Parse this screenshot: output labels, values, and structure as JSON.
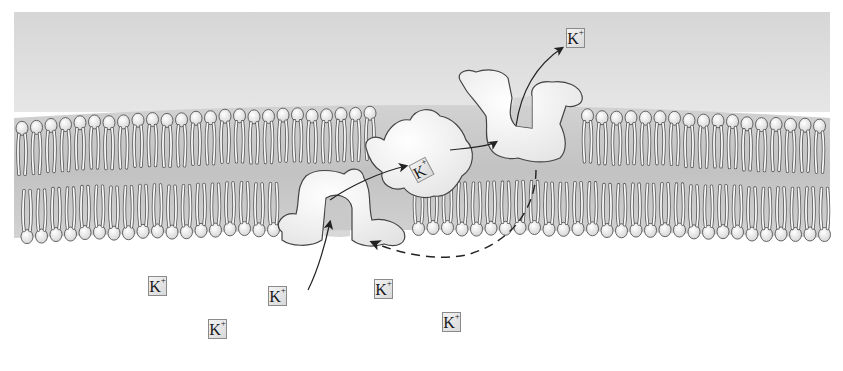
{
  "diagram": {
    "regions": {
      "extracellular": {
        "color": "#dcdcdc"
      },
      "membrane": {
        "head_color": "#eeeeee",
        "outline_color": "#555555"
      },
      "cytoplasm": {
        "color": "#ffffff"
      }
    },
    "ion_label": {
      "symbol": "K",
      "charge": "+"
    },
    "ions": [
      {
        "id": "ion-top-released",
        "symbol": "K",
        "charge": "+",
        "x": 566,
        "y": 28
      },
      {
        "id": "ion-in-transit",
        "symbol": "K",
        "charge": "+",
        "x": 412,
        "y": 160
      },
      {
        "id": "ion-cyto-1",
        "symbol": "K",
        "charge": "+",
        "x": 148,
        "y": 276
      },
      {
        "id": "ion-cyto-2",
        "symbol": "K",
        "charge": "+",
        "x": 268,
        "y": 286
      },
      {
        "id": "ion-cyto-3",
        "symbol": "K",
        "charge": "+",
        "x": 374,
        "y": 279
      },
      {
        "id": "ion-cyto-4",
        "symbol": "K",
        "charge": "+",
        "x": 208,
        "y": 319
      },
      {
        "id": "ion-cyto-5",
        "symbol": "K",
        "charge": "+",
        "x": 442,
        "y": 312
      }
    ],
    "proteins": [
      {
        "id": "carrier-open-inside",
        "state": "open to cytoplasm"
      },
      {
        "id": "carrier-bound",
        "state": "ion bound, rotating"
      },
      {
        "id": "carrier-open-outside",
        "state": "open to exterior"
      }
    ],
    "arrows": [
      {
        "id": "arrow-entry",
        "style": "solid"
      },
      {
        "id": "arrow-to-binding",
        "style": "solid"
      },
      {
        "id": "arrow-to-release",
        "style": "solid"
      },
      {
        "id": "arrow-exit",
        "style": "solid"
      },
      {
        "id": "arrow-reset",
        "style": "dashed"
      }
    ]
  }
}
